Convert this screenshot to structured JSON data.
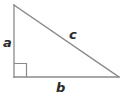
{
  "diagram": {
    "type": "right-triangle",
    "background_color": "#ffffff",
    "stroke_color": "#8a8a8a",
    "label_color": "#2b2b2b",
    "stroke_width": 1.3,
    "vertices": {
      "apex": {
        "x": 14,
        "y": 5,
        "name": "top-vertex"
      },
      "right_angle": {
        "x": 14,
        "y": 77,
        "name": "bottom-left-vertex"
      },
      "base_right": {
        "x": 119,
        "y": 77,
        "name": "bottom-right-vertex"
      }
    },
    "right_angle_marker": {
      "name": "right-angle-square",
      "x": 14,
      "y": 63,
      "size": 13,
      "visible": true
    },
    "sides": [
      {
        "id": "a",
        "label": "a",
        "role": "vertical-leg",
        "from": "apex",
        "to": "right_angle",
        "label_position": {
          "x": 3,
          "y": 36
        }
      },
      {
        "id": "b",
        "label": "b",
        "role": "horizontal-leg",
        "from": "right_angle",
        "to": "base_right",
        "label_position": {
          "x": 56,
          "y": 81
        }
      },
      {
        "id": "c",
        "label": "c",
        "role": "hypotenuse",
        "from": "apex",
        "to": "base_right",
        "label_position": {
          "x": 69,
          "y": 28
        }
      }
    ]
  }
}
